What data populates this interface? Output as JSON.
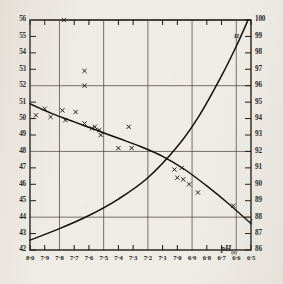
{
  "chart_data": {
    "type": "line",
    "title": "",
    "xlabel": "pH(s)",
    "xlabel_base": "pH",
    "xlabel_sub": "(s)",
    "x_ticks": [
      "8·0",
      "7·9",
      "7·8",
      "7·7",
      "7·6",
      "7·5",
      "7·4",
      "7·3",
      "7·2",
      "7·1",
      "7·0",
      "6·9",
      "6·8",
      "6·7",
      "6·6",
      "6·5"
    ],
    "x_values": [
      8.0,
      7.9,
      7.8,
      7.7,
      7.6,
      7.5,
      7.4,
      7.3,
      7.2,
      7.1,
      7.0,
      6.9,
      6.8,
      6.7,
      6.6,
      6.5
    ],
    "xlim": [
      8.0,
      6.5
    ],
    "x_direction": "descending",
    "left_axis": {
      "ylabel": "",
      "ylim": [
        42,
        56
      ],
      "ticks": [
        "56",
        "55",
        "54",
        "53",
        "52",
        "51",
        "50",
        "49",
        "48",
        "47",
        "46",
        "45",
        "44",
        "43",
        "42"
      ],
      "values": [
        56,
        55,
        54,
        53,
        52,
        51,
        50,
        49,
        48,
        47,
        46,
        45,
        44,
        43,
        42
      ]
    },
    "right_axis": {
      "ylabel": "",
      "ylim": [
        86,
        100
      ],
      "ticks": [
        "100",
        "99",
        "98",
        "97",
        "96",
        "95",
        "94",
        "93",
        "92",
        "91",
        "90",
        "89",
        "88",
        "87",
        "86"
      ],
      "values": [
        100,
        99,
        98,
        97,
        96,
        95,
        94,
        93,
        92,
        91,
        90,
        89,
        88,
        87,
        86
      ]
    },
    "grid": {
      "horizontal_left_values": [
        56,
        52,
        48,
        44
      ],
      "vertical_x_values": [
        7.8,
        7.5,
        7.2,
        6.9,
        6.6
      ],
      "enabled": true
    },
    "legend_position": "inline-curve-labels",
    "series": [
      {
        "name": "I",
        "label": "I",
        "axis": "left",
        "style": "solid-line-with-x-markers",
        "x": [
          8.0,
          7.85,
          7.7,
          7.55,
          7.4,
          7.25,
          7.1,
          6.95,
          6.8,
          6.65,
          6.5
        ],
        "values": [
          50.9,
          50.3,
          49.8,
          49.3,
          48.8,
          48.3,
          47.7,
          46.9,
          45.9,
          44.8,
          43.6
        ]
      },
      {
        "name": "II",
        "label": "II",
        "axis": "right",
        "style": "solid-line",
        "x": [
          8.0,
          7.8,
          7.6,
          7.4,
          7.2,
          7.0,
          6.85,
          6.7,
          6.6,
          6.52
        ],
        "values": [
          86.6,
          87.3,
          88.1,
          89.1,
          90.4,
          92.3,
          94.2,
          96.6,
          98.4,
          100.0
        ]
      }
    ],
    "scatter_points": [
      {
        "x": 7.96,
        "y": 50.2,
        "series": "I"
      },
      {
        "x": 7.9,
        "y": 50.6,
        "series": "I"
      },
      {
        "x": 7.86,
        "y": 50.1,
        "series": "I"
      },
      {
        "x": 7.78,
        "y": 50.5,
        "series": "I"
      },
      {
        "x": 7.76,
        "y": 49.9,
        "series": "I"
      },
      {
        "x": 7.69,
        "y": 50.4,
        "series": "I"
      },
      {
        "x": 7.63,
        "y": 49.7,
        "series": "I"
      },
      {
        "x": 7.58,
        "y": 49.4,
        "series": "I"
      },
      {
        "x": 7.56,
        "y": 49.5,
        "series": "I"
      },
      {
        "x": 7.53,
        "y": 49.3,
        "series": "I"
      },
      {
        "x": 7.52,
        "y": 49.0,
        "series": "I"
      },
      {
        "x": 7.4,
        "y": 48.2,
        "series": "I"
      },
      {
        "x": 7.31,
        "y": 48.2,
        "series": "I"
      },
      {
        "x": 7.33,
        "y": 49.5,
        "series": "I"
      },
      {
        "x": 7.02,
        "y": 46.9,
        "series": "I"
      },
      {
        "x": 6.97,
        "y": 47.0,
        "series": "I"
      },
      {
        "x": 7.0,
        "y": 46.4,
        "series": "I"
      },
      {
        "x": 6.96,
        "y": 46.3,
        "series": "I"
      },
      {
        "x": 6.92,
        "y": 46.0,
        "series": "I"
      },
      {
        "x": 6.86,
        "y": 45.5,
        "series": "I"
      },
      {
        "x": 6.62,
        "y": 44.7,
        "series": "I"
      },
      {
        "x": 7.63,
        "y": 52.9,
        "series": "I"
      },
      {
        "x": 7.63,
        "y": 52.0,
        "series": "I"
      },
      {
        "x": 7.77,
        "y": 56.0,
        "series": "I"
      }
    ]
  }
}
